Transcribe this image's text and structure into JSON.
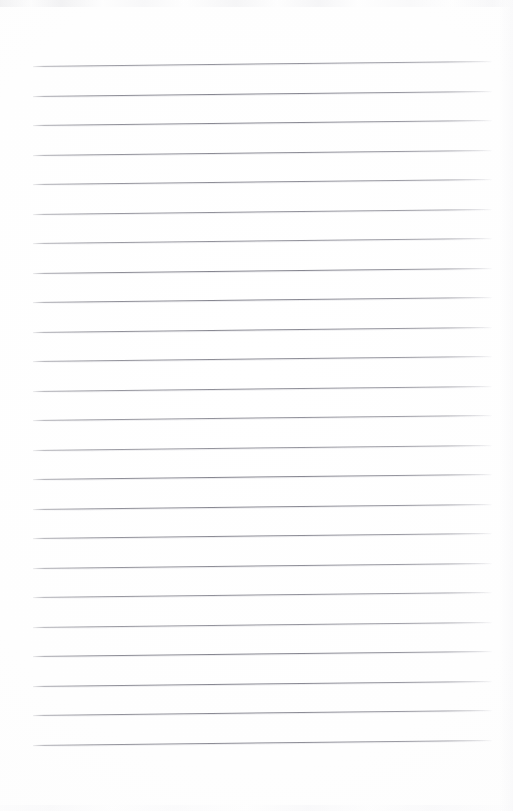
{
  "document": {
    "kind": "scanned-lined-paper",
    "title": "Blank lined notebook page",
    "page_width": 513,
    "page_height": 811,
    "paper_color": "#fefefe",
    "text_content": "",
    "has_handwriting": false,
    "has_printed_text": false
  },
  "ruling": {
    "line_color": "#84848e",
    "line_count": 24,
    "first_line_y": 66,
    "line_spacing": 29.5,
    "line_left_x": 33,
    "line_right_x": 492,
    "line_thickness": 1,
    "slope_rise_px": -5,
    "lines_y": [
      66,
      95.5,
      125,
      154.5,
      184,
      213.5,
      243,
      272.5,
      302,
      331.5,
      361,
      390.5,
      420,
      449.5,
      479,
      508.5,
      538,
      567.5,
      597,
      626.5,
      656,
      685.5,
      715,
      744.5
    ]
  },
  "margins": {
    "top": 60,
    "bottom": 66,
    "left": 33,
    "right": 21
  },
  "artifacts": {
    "top_edge_band": "faint-gray-mottle",
    "bottom_edge_band": "faint-gray-mottle",
    "right_edge_shade": "soft-gradient"
  }
}
